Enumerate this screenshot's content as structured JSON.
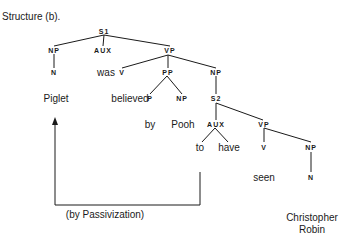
{
  "title": "Structure (b).",
  "nodes": {
    "s1": "S1",
    "np1": "NP",
    "aux1": "AUX",
    "vp1": "VP",
    "n1": "N",
    "was": "was",
    "v1": "V",
    "pp": "PP",
    "np2": "NP",
    "piglet": "Piglet",
    "believed": "believed",
    "p": "P",
    "np3": "NP",
    "s2": "S2",
    "by": "by",
    "pooh": "Pooh",
    "aux2": "AUX",
    "vp2": "VP",
    "to": "to",
    "have": "have",
    "v2": "V",
    "np4": "NP",
    "seen": "seen",
    "n2": "N",
    "christopher": "Christopher",
    "robin": "Robin"
  },
  "arrow_label": "(by Passivization)",
  "colors": {
    "ink": "#1a1a1a",
    "background": "#ffffff"
  }
}
